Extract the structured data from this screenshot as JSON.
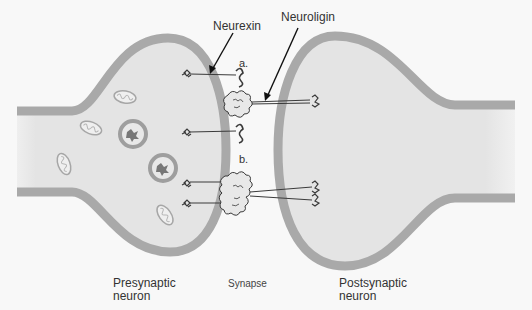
{
  "diagram": {
    "type": "biological-illustration",
    "labels": {
      "neurexin": "Neurexin",
      "neuroligin": "Neuroligin",
      "complex_a": "a.",
      "complex_b": "b.",
      "presynaptic": "Presynaptic\nneuron",
      "synapse": "Synapse",
      "postsynaptic": "Postsynaptic\nneuron"
    },
    "colors": {
      "background": "#f8f8f8",
      "cytoplasm": "#e4e4e4",
      "membrane": "#a9a9a9",
      "protein": "#3a3a3a",
      "arrow": "#111111"
    },
    "structures": {
      "vesicles": [
        {
          "cx": 133,
          "cy": 134
        },
        {
          "cx": 163,
          "cy": 168
        }
      ],
      "mitochondria": [
        {
          "cx": 125,
          "cy": 97,
          "rot": 10
        },
        {
          "cx": 91,
          "cy": 128,
          "rot": 20
        },
        {
          "cx": 64,
          "cy": 164,
          "rot": 70
        },
        {
          "cx": 165,
          "cy": 215,
          "rot": 55
        }
      ]
    }
  }
}
